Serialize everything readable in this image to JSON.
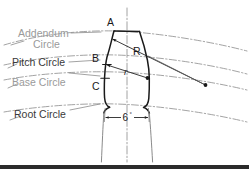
{
  "figure": {
    "background_color": "#ffffff",
    "width": 249,
    "height": 174,
    "labels": {
      "addendum_line1": "Addendum",
      "addendum_line2": "Circle",
      "pitch_circle": "Pitch Circle",
      "base_circle": "Base Circle",
      "root_circle": "Root Circle",
      "point_a": "A",
      "point_b": "B",
      "point_c": "C",
      "radius_major": "R",
      "radius_minor": "r",
      "angle_value": "6",
      "angle_unit": "°"
    },
    "colors": {
      "gray_label": "#9a9a9a",
      "dark_label": "#3a3a3a",
      "outline": "#1a1a1a",
      "construction_line": "#8c8c8c",
      "leader_line": "#7d7d7d",
      "footer_bar": "#2b2b2b"
    },
    "footer_bar": {
      "present": true,
      "y": 165,
      "height": 4
    }
  }
}
